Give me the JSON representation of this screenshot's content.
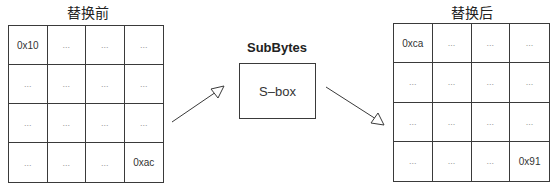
{
  "before": {
    "title": "替换前",
    "cells": [
      [
        "0x10",
        "...",
        "...",
        "..."
      ],
      [
        "...",
        "...",
        "...",
        "..."
      ],
      [
        "...",
        "...",
        "...",
        "..."
      ],
      [
        "...",
        "...",
        "...",
        "0xac"
      ]
    ]
  },
  "transform": {
    "label": "SubBytes",
    "box_text": "S–box"
  },
  "after": {
    "title": "替换后",
    "cells": [
      [
        "0xca",
        "...",
        "...",
        "..."
      ],
      [
        "...",
        "...",
        "...",
        "..."
      ],
      [
        "...",
        "...",
        "...",
        "..."
      ],
      [
        "...",
        "...",
        "...",
        "0x91"
      ]
    ]
  },
  "colors": {
    "line": "#3a3a3a",
    "ellipsis": "#999999"
  }
}
